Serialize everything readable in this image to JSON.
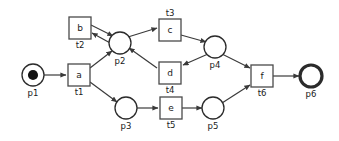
{
  "diagram": {
    "kind": "petri-net",
    "title": "",
    "background_color": "#ffffff",
    "stroke_color": "#3a3a3a",
    "text_color": "#1a1a1a",
    "places": [
      {
        "id": "p1",
        "label": "p1",
        "cx": 33,
        "cy": 75,
        "r": 11,
        "tokens": 1,
        "final": false
      },
      {
        "id": "p2",
        "label": "p2",
        "cx": 120,
        "cy": 43,
        "r": 11,
        "tokens": 0,
        "final": false
      },
      {
        "id": "p3",
        "label": "p3",
        "cx": 126,
        "cy": 108,
        "r": 11,
        "tokens": 0,
        "final": false
      },
      {
        "id": "p4",
        "label": "p4",
        "cx": 215,
        "cy": 47,
        "r": 11,
        "tokens": 0,
        "final": false
      },
      {
        "id": "p5",
        "label": "p5",
        "cx": 213,
        "cy": 108,
        "r": 11,
        "tokens": 0,
        "final": false
      },
      {
        "id": "p6",
        "label": "p6",
        "cx": 311,
        "cy": 76,
        "r": 11,
        "tokens": 0,
        "final": true
      }
    ],
    "transitions": [
      {
        "id": "t1",
        "name": "a",
        "label": "t1",
        "x": 68,
        "y": 64,
        "w": 22,
        "h": 22,
        "label_pos": "below"
      },
      {
        "id": "t2",
        "name": "b",
        "label": "t2",
        "x": 69,
        "y": 17,
        "w": 22,
        "h": 22,
        "label_pos": "below"
      },
      {
        "id": "t3",
        "name": "c",
        "label": "t3",
        "x": 159,
        "y": 19,
        "w": 22,
        "h": 22,
        "label_pos": "above"
      },
      {
        "id": "t4",
        "name": "d",
        "label": "t4",
        "x": 159,
        "y": 62,
        "w": 22,
        "h": 22,
        "label_pos": "below"
      },
      {
        "id": "t5",
        "name": "e",
        "label": "t5",
        "x": 160,
        "y": 97,
        "w": 22,
        "h": 22,
        "label_pos": "below"
      },
      {
        "id": "t6",
        "name": "f",
        "label": "t6",
        "x": 251,
        "y": 65,
        "w": 22,
        "h": 22,
        "label_pos": "below"
      }
    ],
    "arcs": [
      {
        "from": "p1",
        "to": "t1",
        "x1": 44,
        "y1": 75,
        "x2": 66,
        "y2": 75
      },
      {
        "from": "t1",
        "to": "p2",
        "x1": 90,
        "y1": 68,
        "x2": 112,
        "y2": 51
      },
      {
        "from": "t1",
        "to": "p3",
        "x1": 90,
        "y1": 82,
        "x2": 117,
        "y2": 102
      },
      {
        "from": "t2",
        "to": "p2",
        "x1": 91,
        "y1": 25,
        "x2": 113,
        "y2": 36
      },
      {
        "from": "p2",
        "to": "t2",
        "x1": 112,
        "y1": 44,
        "x2": 92,
        "y2": 33
      },
      {
        "from": "p2",
        "to": "t3",
        "x1": 128,
        "y1": 37,
        "x2": 157,
        "y2": 28
      },
      {
        "from": "t3",
        "to": "p4",
        "x1": 181,
        "y1": 35,
        "x2": 206,
        "y2": 42
      },
      {
        "from": "p4",
        "to": "t4",
        "x1": 208,
        "y1": 54,
        "x2": 183,
        "y2": 65
      },
      {
        "from": "t4",
        "to": "p2",
        "x1": 157,
        "y1": 68,
        "x2": 129,
        "y2": 48
      },
      {
        "from": "p4",
        "to": "t6",
        "x1": 222,
        "y1": 54,
        "x2": 250,
        "y2": 68
      },
      {
        "from": "p3",
        "to": "t5",
        "x1": 137,
        "y1": 108,
        "x2": 158,
        "y2": 108
      },
      {
        "from": "t5",
        "to": "p5",
        "x1": 182,
        "y1": 108,
        "x2": 202,
        "y2": 108
      },
      {
        "from": "p5",
        "to": "t6",
        "x1": 222,
        "y1": 103,
        "x2": 250,
        "y2": 85
      },
      {
        "from": "t6",
        "to": "p6",
        "x1": 273,
        "y1": 76,
        "x2": 299,
        "y2": 76
      }
    ]
  }
}
